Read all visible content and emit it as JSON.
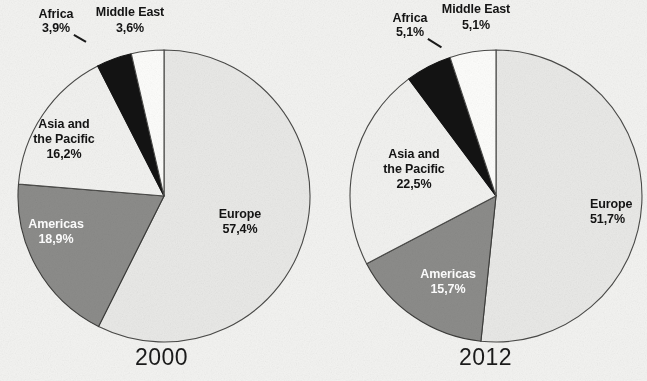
{
  "figure": {
    "background_color": "#f3f3f1",
    "text_color": "#141414"
  },
  "charts": [
    {
      "id": "chart-2000",
      "year_label": "2000",
      "labels": {
        "europe_name": "Europe",
        "europe_value": "57,4%",
        "americas_name": "Americas",
        "americas_value": "18,9%",
        "asia_name_line1": "Asia and",
        "asia_name_line2": "the Pacific",
        "asia_value": "16,2%",
        "africa_name": "Africa",
        "africa_value": "3,9%",
        "middleeast_name": "Middle East",
        "middleeast_value": "3,6%"
      }
    },
    {
      "id": "chart-2012",
      "year_label": "2012",
      "labels": {
        "europe_name": "Europe",
        "europe_value": "51,7%",
        "americas_name": "Americas",
        "americas_value": "15,7%",
        "asia_name_line1": "Asia and",
        "asia_name_line2": "the Pacific",
        "asia_value": "22,5%",
        "africa_name": "Africa",
        "africa_value": "5,1%",
        "middleeast_name": "Middle East",
        "middleeast_value": "5,1%"
      }
    }
  ],
  "chart_data": [
    {
      "type": "pie",
      "title": "2000",
      "categories": [
        "Europe",
        "Americas",
        "Asia and the Pacific",
        "Africa",
        "Middle East"
      ],
      "values": [
        57.4,
        18.9,
        16.2,
        3.9,
        3.6
      ],
      "value_labels": [
        "57,4%",
        "18,9%",
        "16,2%",
        "3,9%",
        "3,6%"
      ],
      "unit": "%",
      "colors": [
        "#e9e9e7",
        "#8c8c8a",
        "#f2f2f0",
        "#131313",
        "#fdfdfb"
      ],
      "start_angle_deg": 0,
      "direction": "clockwise",
      "legend": "none",
      "labels_inside": [
        "Europe",
        "Americas",
        "Asia and the Pacific"
      ],
      "labels_outside": [
        "Africa",
        "Middle East"
      ]
    },
    {
      "type": "pie",
      "title": "2012",
      "categories": [
        "Europe",
        "Americas",
        "Asia and the Pacific",
        "Africa",
        "Middle East"
      ],
      "values": [
        51.7,
        15.7,
        22.5,
        5.1,
        5.1
      ],
      "value_labels": [
        "51,7%",
        "15,7%",
        "22,5%",
        "5,1%",
        "5,1%"
      ],
      "unit": "%",
      "colors": [
        "#e9e9e7",
        "#8c8c8a",
        "#f2f2f0",
        "#131313",
        "#fdfdfb"
      ],
      "start_angle_deg": 0,
      "direction": "clockwise",
      "legend": "none",
      "labels_inside": [
        "Europe",
        "Americas",
        "Asia and the Pacific"
      ],
      "labels_outside": [
        "Africa",
        "Middle East"
      ]
    }
  ]
}
